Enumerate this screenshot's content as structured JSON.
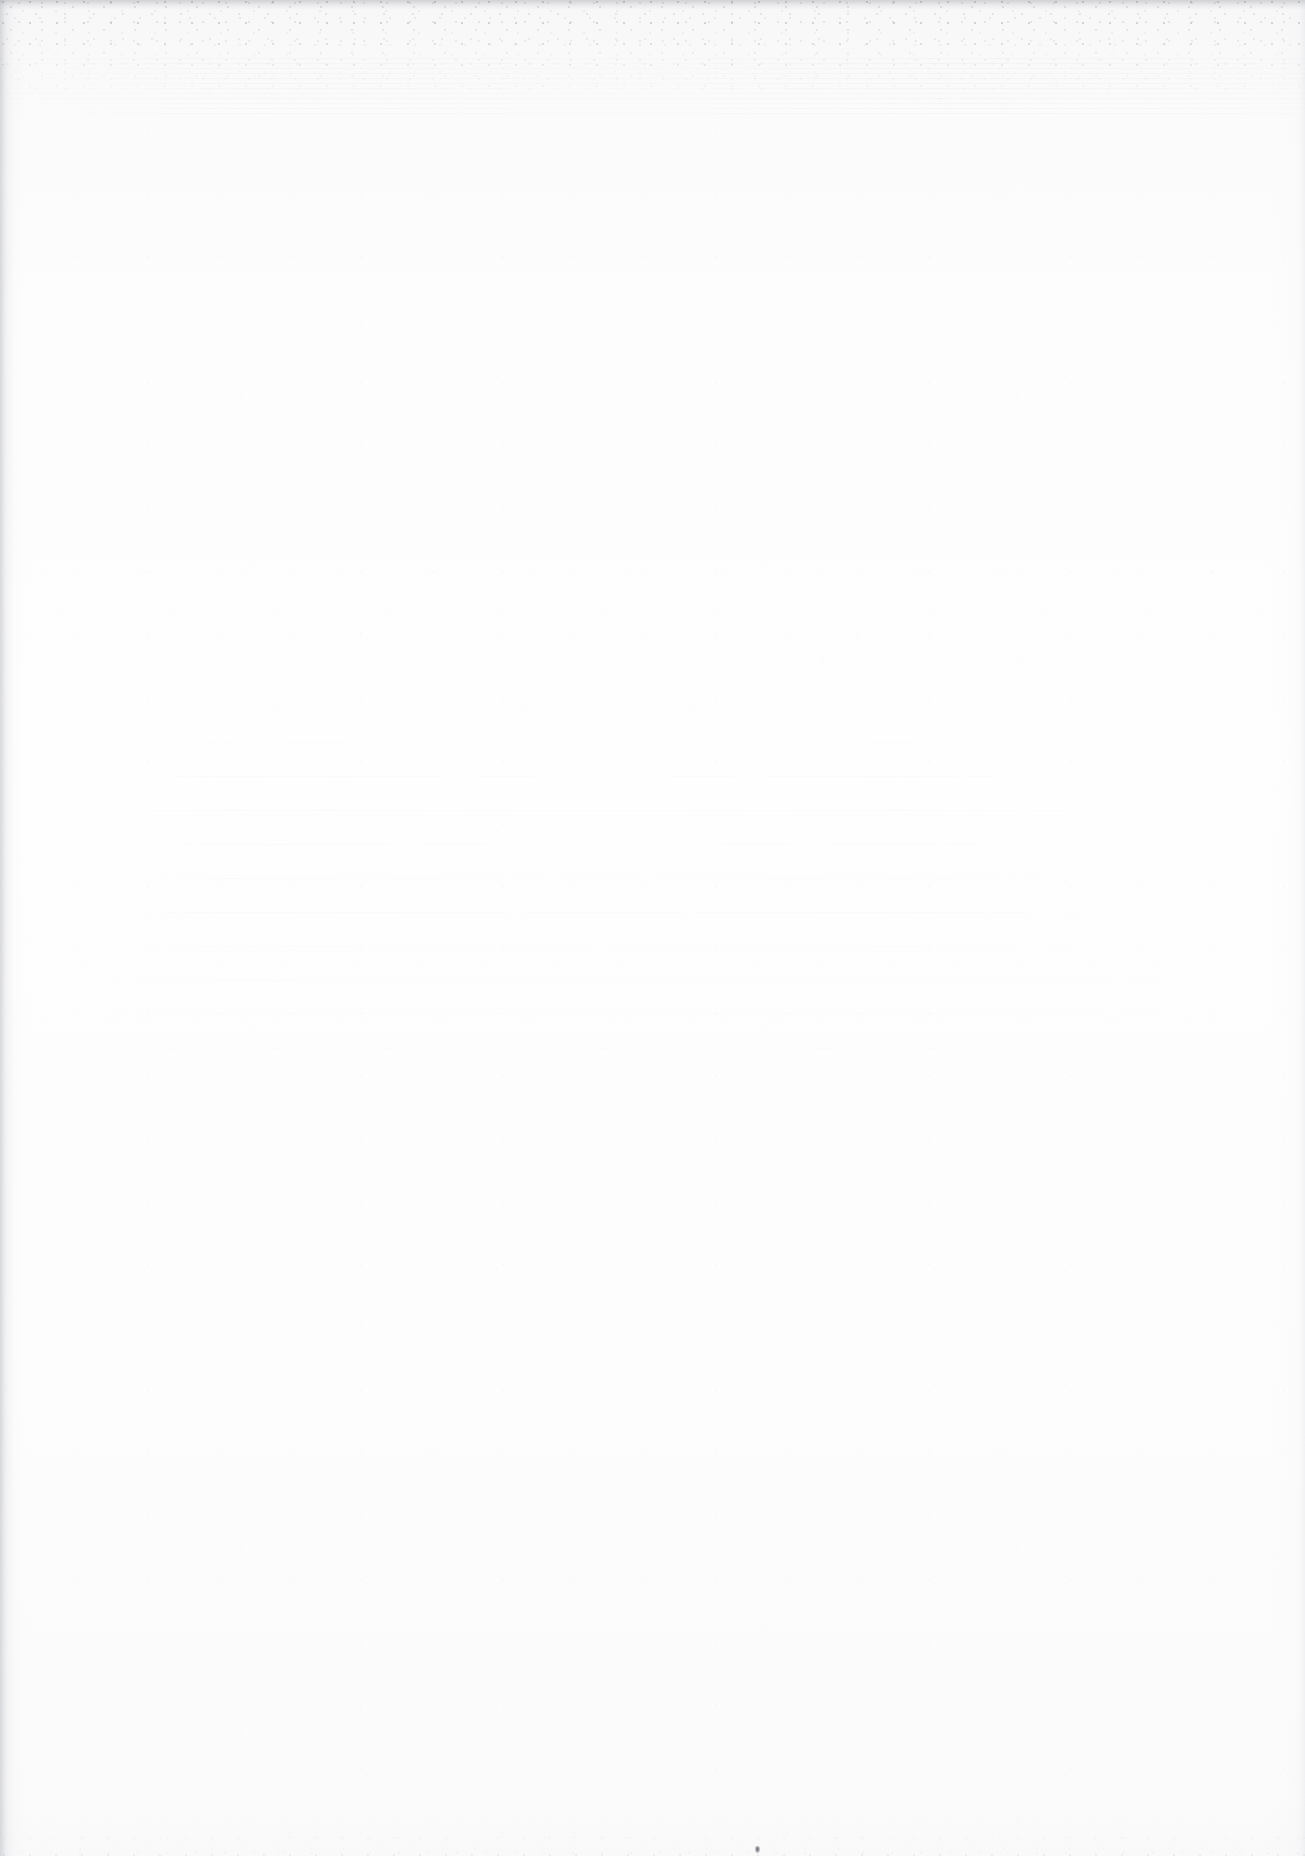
{
  "page": {
    "kind": "scanned-blank-page",
    "width": 1305,
    "height": 1856,
    "text_content": "",
    "visible_text_elements": [],
    "paper_color": "#fdfdfd",
    "background_color": "#ffffff"
  },
  "artifacts": {
    "top_grain_band": {
      "name": "top-edge-scan-grain",
      "color": "#60626a",
      "top": 0,
      "height": 120
    },
    "top_edge_line": {
      "name": "top-edge-shadow",
      "color": "#787a82",
      "top": 0,
      "height": 10
    },
    "top_streaks": {
      "name": "top-horizontal-streaks",
      "color": "#9698a0",
      "top": 58,
      "height": 58
    },
    "left_edge": {
      "name": "left-edge-shadow",
      "color": "#a8aab2",
      "left": 0,
      "width": 14
    },
    "right_edge": {
      "name": "right-edge-shadow",
      "color": "#d6d8de",
      "width": 12
    },
    "bottom_grain_band": {
      "name": "bottom-edge-scan-grain",
      "color": "#969aa0",
      "height": 38
    },
    "ghost_bands": {
      "name": "bleed-through-ghost-banding",
      "color": "#9698a2",
      "left": 90,
      "top": 640,
      "width": 1130,
      "height": 780
    },
    "debris_speck": {
      "name": "debris-speck",
      "color": "#565860",
      "x": 755,
      "y": 1846,
      "width": 5,
      "height": 7
    }
  }
}
